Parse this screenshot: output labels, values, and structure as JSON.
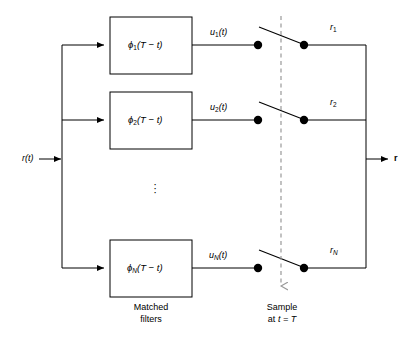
{
  "diagram": {
    "input": {
      "label": "r(t)",
      "arrow_icon": "arrow-right-icon"
    },
    "output": {
      "label": "r",
      "arrow_icon": "arrow-right-icon"
    },
    "branches": [
      {
        "id": "branch-1",
        "filter_label": "ϕ₁(T − t)",
        "filter_base": "ϕ",
        "filter_sub": "1",
        "filter_arg": "(T − t)",
        "signal_base": "u",
        "signal_sub": "1",
        "signal_arg": "(t)",
        "signal_label": "u₁(t)",
        "output_base": "r",
        "output_sub": "1",
        "output_label": "r₁"
      },
      {
        "id": "branch-2",
        "filter_label": "ϕ₂(T − t)",
        "filter_base": "ϕ",
        "filter_sub": "2",
        "filter_arg": "(T − t)",
        "signal_base": "u",
        "signal_sub": "2",
        "signal_arg": "(t)",
        "signal_label": "u₂(t)",
        "output_base": "r",
        "output_sub": "2",
        "output_label": "r₂"
      },
      {
        "id": "branch-n",
        "filter_label": "ϕN(T − t)",
        "filter_base": "ϕ",
        "filter_sub": "N",
        "filter_arg": "(T − t)",
        "signal_base": "u",
        "signal_sub": "N",
        "signal_arg": "(t)",
        "signal_label": "uN(t)",
        "output_base": "r",
        "output_sub": "N",
        "output_label": "rN"
      }
    ],
    "ellipsis": "⋮",
    "captions": {
      "filters_line1": "Matched",
      "filters_line2": "filters",
      "sample_line1": "Sample",
      "sample_line2_prefix": "at ",
      "sample_line2_expr": "t = T"
    },
    "colors": {
      "stroke": "#000000",
      "background": "#ffffff",
      "dashed": "#999999",
      "node": "#000000"
    }
  }
}
